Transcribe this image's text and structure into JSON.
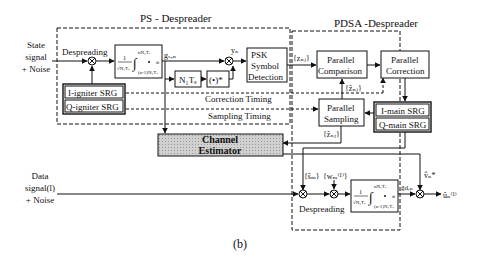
{
  "figure_label": "(b)",
  "ps_despreader": {
    "title": "PS - Despreader",
    "input_label": [
      "State",
      "signal",
      "+ Noise"
    ],
    "despreading_label": "Despreading",
    "integrator": {
      "frac": "1",
      "denom": "√N₁Tₑ",
      "upper": "nN₁Tₑ",
      "lower": "(n-1)N₁Tₑ",
      "dt": "dt"
    },
    "g_label": "gₛ,ₙ",
    "delay_label": "N₁Tₑ",
    "conj_label": "(•)*",
    "y_label": "yₙ",
    "psk_block": [
      "PSK",
      "Symbol",
      "Detection"
    ],
    "i_igniter": "I-igniter SRG",
    "q_igniter": "Q-igniter SRG",
    "correction_timing": "Correction Timing",
    "sampling_timing": "Sampling Timing"
  },
  "pdsa_despreader": {
    "title": "PDSA -Despreader",
    "z_label": "{zₙⱼ}",
    "zhat_label_1": "{ẑₙⱼ}",
    "zhat_label_2": "{ẑₙⱼ}",
    "parallel_comparison": [
      "Parallel",
      "Comparison"
    ],
    "parallel_correction": [
      "Parallel",
      "Correction"
    ],
    "parallel_sampling": [
      "Parallel",
      "Sampling"
    ],
    "i_main": "I-main SRG",
    "q_main": "Q-main SRG",
    "s_label": "{ŝₘ}",
    "w_label": "{wₘ⁽¹⁾}",
    "despreading_label": "Despreading",
    "g_d_label": "g̃d,ₙ",
    "v_label": "v̂ₙ*",
    "u_label": "ûₙ⁽¹⁾"
  },
  "channel_estimator": [
    "Channel",
    "Estimator"
  ],
  "data_input_label": [
    "Data",
    "signal(l)",
    "+ Noise"
  ],
  "colors": {
    "line": "#111111",
    "estimator_fill": "#c8c8c8"
  }
}
